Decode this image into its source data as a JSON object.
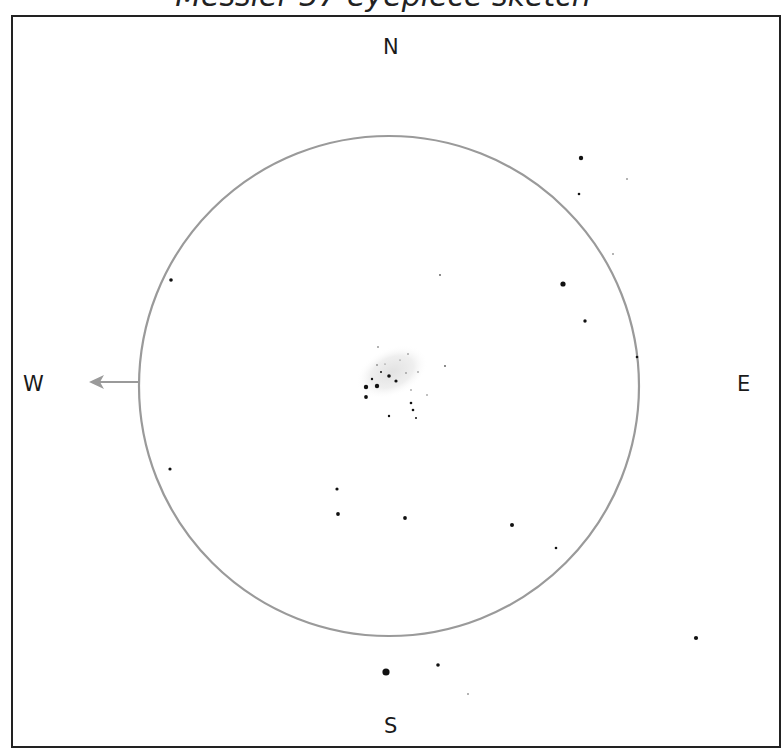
{
  "title": "Messier 37 eyepiece sketch",
  "compass": {
    "north": "N",
    "south": "S",
    "east": "E",
    "west": "W"
  },
  "field_of_view": {
    "cx": 389,
    "cy": 386,
    "r": 250,
    "stroke": "#9a9a9a"
  },
  "drift_arrow": {
    "direction": "west",
    "color": "#9a9a9a"
  },
  "nebulosity": {
    "cx": 392,
    "cy": 372,
    "rx": 38,
    "ry": 24,
    "color": "#e6e6e6"
  },
  "stars": [
    {
      "x": 581,
      "y": 158,
      "r": 2.2
    },
    {
      "x": 579,
      "y": 194,
      "r": 1.3
    },
    {
      "x": 627,
      "y": 179,
      "r": 0.8
    },
    {
      "x": 613,
      "y": 254,
      "r": 0.8
    },
    {
      "x": 563,
      "y": 284,
      "r": 2.6
    },
    {
      "x": 585,
      "y": 321,
      "r": 1.7
    },
    {
      "x": 637,
      "y": 357,
      "r": 1.3
    },
    {
      "x": 171,
      "y": 280,
      "r": 1.8
    },
    {
      "x": 440,
      "y": 275,
      "r": 0.9
    },
    {
      "x": 445,
      "y": 366,
      "r": 0.9
    },
    {
      "x": 170,
      "y": 469,
      "r": 1.6
    },
    {
      "x": 337,
      "y": 489,
      "r": 1.6
    },
    {
      "x": 338,
      "y": 514,
      "r": 1.9
    },
    {
      "x": 405,
      "y": 518,
      "r": 1.9
    },
    {
      "x": 512,
      "y": 525,
      "r": 2.0
    },
    {
      "x": 556,
      "y": 548,
      "r": 1.3
    },
    {
      "x": 696,
      "y": 638,
      "r": 2.1
    },
    {
      "x": 386,
      "y": 672,
      "r": 3.6
    },
    {
      "x": 438,
      "y": 665,
      "r": 1.8
    },
    {
      "x": 468,
      "y": 694,
      "r": 0.8
    },
    {
      "x": 366,
      "y": 387,
      "r": 2.2
    },
    {
      "x": 366,
      "y": 397,
      "r": 1.9
    },
    {
      "x": 377,
      "y": 386,
      "r": 2.2
    },
    {
      "x": 372,
      "y": 379,
      "r": 1.2
    },
    {
      "x": 389,
      "y": 376,
      "r": 1.8
    },
    {
      "x": 396,
      "y": 381,
      "r": 1.6
    },
    {
      "x": 381,
      "y": 372,
      "r": 1.0
    },
    {
      "x": 377,
      "y": 365,
      "r": 0.8
    },
    {
      "x": 378,
      "y": 347,
      "r": 0.8
    },
    {
      "x": 406,
      "y": 373,
      "r": 0.7
    },
    {
      "x": 411,
      "y": 403,
      "r": 1.3
    },
    {
      "x": 413,
      "y": 410,
      "r": 1.3
    },
    {
      "x": 416,
      "y": 418,
      "r": 1.0
    },
    {
      "x": 389,
      "y": 416,
      "r": 1.2
    },
    {
      "x": 408,
      "y": 354,
      "r": 0.7
    },
    {
      "x": 418,
      "y": 372,
      "r": 0.7
    },
    {
      "x": 411,
      "y": 390,
      "r": 0.7
    },
    {
      "x": 427,
      "y": 395,
      "r": 0.7
    },
    {
      "x": 400,
      "y": 360,
      "r": 0.6
    },
    {
      "x": 385,
      "y": 364,
      "r": 0.6
    }
  ]
}
